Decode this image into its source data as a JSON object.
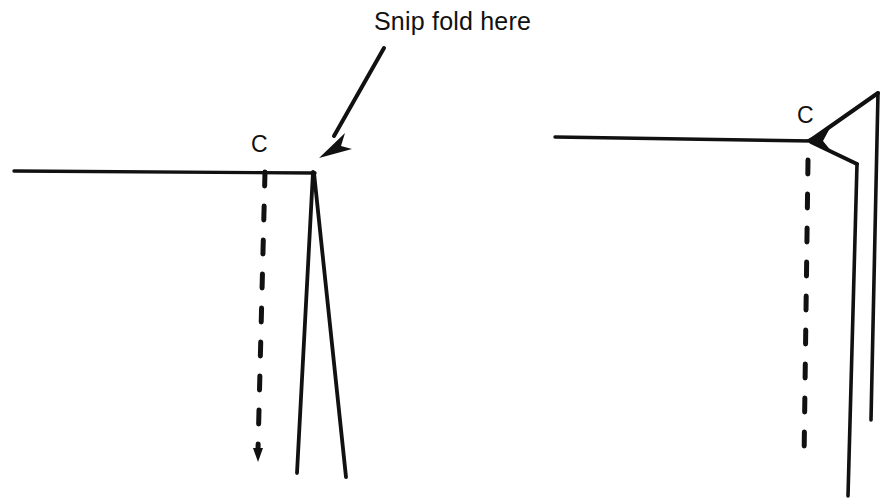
{
  "figure": {
    "title": "Snip fold here",
    "annotation": {
      "text": "Snip fold here",
      "icon": "arrow-down-left-icon",
      "points_to": "left-panel-fold-apex"
    },
    "ink_color": "#111111",
    "background_color": "#ffffff",
    "panels": [
      {
        "id": "left-panel",
        "name": "before-snip",
        "point_label": "C",
        "elements": [
          "horizontal-edge-line",
          "dashed-fold-line-with-arrow",
          "v-flap-outline"
        ]
      },
      {
        "id": "right-panel",
        "name": "after-snip",
        "point_label": "C",
        "elements": [
          "horizontal-edge-line",
          "dashed-fold-line",
          "snipped-flap-outline",
          "arrowhead-at-point-c"
        ]
      }
    ]
  }
}
